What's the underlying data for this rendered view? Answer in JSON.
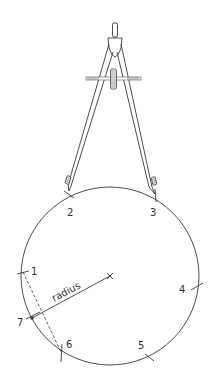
{
  "figure": {
    "ink_color": "#3a3a3a",
    "background": "#ffffff"
  },
  "labels": {
    "radius": "radius",
    "points": [
      "1",
      "2",
      "3",
      "4",
      "5",
      "6",
      "7"
    ]
  },
  "icons": {
    "compass": "drawing-compass-icon",
    "center_mark": "cross-mark-icon"
  }
}
